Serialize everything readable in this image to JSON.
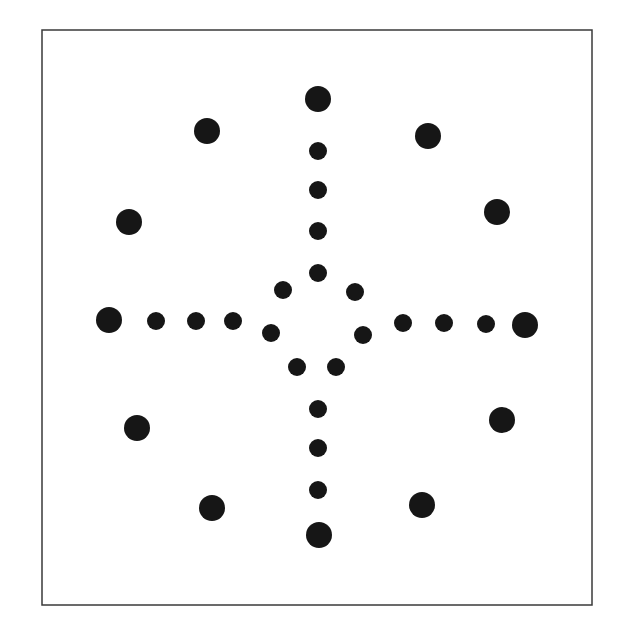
{
  "canvas": {
    "width": 619,
    "height": 640,
    "background": "#ffffff"
  },
  "frame": {
    "x": 42,
    "y": 30,
    "width": 550,
    "height": 575,
    "stroke": "#3a3a3a",
    "stroke_width": 1.5
  },
  "dot_color": "#161616",
  "large_radius": 13,
  "small_radius": 9,
  "outer_ring_dots": [
    {
      "name": "outer-dot-top",
      "x": 318,
      "y": 99
    },
    {
      "name": "outer-dot-top-right",
      "x": 428,
      "y": 136
    },
    {
      "name": "outer-dot-right-upper",
      "x": 497,
      "y": 212
    },
    {
      "name": "outer-dot-right",
      "x": 525,
      "y": 325
    },
    {
      "name": "outer-dot-right-lower",
      "x": 502,
      "y": 420
    },
    {
      "name": "outer-dot-bottom-right",
      "x": 422,
      "y": 505
    },
    {
      "name": "outer-dot-bottom",
      "x": 319,
      "y": 535
    },
    {
      "name": "outer-dot-bottom-left",
      "x": 212,
      "y": 508
    },
    {
      "name": "outer-dot-left-lower",
      "x": 137,
      "y": 428
    },
    {
      "name": "outer-dot-left",
      "x": 109,
      "y": 320
    },
    {
      "name": "outer-dot-left-upper",
      "x": 129,
      "y": 222
    },
    {
      "name": "outer-dot-top-left",
      "x": 207,
      "y": 131
    }
  ],
  "spoke_dots": [
    {
      "name": "spoke-dot-up-1",
      "x": 318,
      "y": 151
    },
    {
      "name": "spoke-dot-up-2",
      "x": 318,
      "y": 190
    },
    {
      "name": "spoke-dot-up-3",
      "x": 318,
      "y": 231
    },
    {
      "name": "spoke-dot-up-4",
      "x": 318,
      "y": 273
    },
    {
      "name": "spoke-dot-left-1",
      "x": 156,
      "y": 321
    },
    {
      "name": "spoke-dot-left-2",
      "x": 196,
      "y": 321
    },
    {
      "name": "spoke-dot-left-3",
      "x": 233,
      "y": 321
    },
    {
      "name": "spoke-dot-right-1",
      "x": 403,
      "y": 323
    },
    {
      "name": "spoke-dot-right-2",
      "x": 444,
      "y": 323
    },
    {
      "name": "spoke-dot-right-3",
      "x": 486,
      "y": 324
    },
    {
      "name": "spoke-dot-down-1",
      "x": 318,
      "y": 409
    },
    {
      "name": "spoke-dot-down-2",
      "x": 318,
      "y": 448
    },
    {
      "name": "spoke-dot-down-3",
      "x": 318,
      "y": 490
    }
  ],
  "inner_ring_dots": [
    {
      "name": "inner-dot-upper-left",
      "x": 283,
      "y": 290
    },
    {
      "name": "inner-dot-upper-right",
      "x": 355,
      "y": 292
    },
    {
      "name": "inner-dot-mid-left",
      "x": 271,
      "y": 333
    },
    {
      "name": "inner-dot-mid-right",
      "x": 363,
      "y": 335
    },
    {
      "name": "inner-dot-lower-left",
      "x": 297,
      "y": 367
    },
    {
      "name": "inner-dot-lower-right",
      "x": 336,
      "y": 367
    }
  ]
}
